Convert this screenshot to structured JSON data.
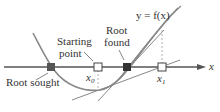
{
  "diagram": {
    "curve_label": "y = f(x)",
    "axis_label": "x",
    "labels": {
      "root_sought": "Root sought",
      "starting_point_line1": "Starting",
      "starting_point_line2": "point",
      "root_found_line1": "Root",
      "root_found_line2": "found",
      "x0_base": "x",
      "x0_sub": "0",
      "x1_base": "x",
      "x1_sub": "1"
    },
    "colors": {
      "curve": "#808080",
      "axis": "#555555",
      "marker_fill": "#555555",
      "text": "#333333"
    }
  }
}
